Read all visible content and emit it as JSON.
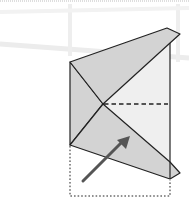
{
  "diagram": {
    "type": "origami-fold-step",
    "colors": {
      "background": "#ffffff",
      "paper_colored": "#d3d3d3",
      "paper_light": "#efefef",
      "outline": "#222222",
      "arrow": "#555555",
      "faint_bg_lines": "#ececec",
      "top_border": "#bdbdbd"
    },
    "elements": {
      "top_flap": {
        "description": "upper triangular flap folded up and to the right"
      },
      "left_triangle": {
        "description": "left gray triangle formed by diagonal creases"
      },
      "bottom_flap": {
        "description": "lower triangular flap folded down and to the right"
      },
      "right_panel": {
        "description": "light-colored right panel of the square"
      },
      "valley_fold_line": {
        "style": "dashed",
        "description": "horizontal valley fold from center to right edge"
      },
      "previous_position": {
        "style": "dotted",
        "description": "outline of the flap's original position below"
      },
      "fold_arrow": {
        "icon": "arrow-up-right",
        "description": "arrow indicating folding the bottom up"
      }
    }
  }
}
